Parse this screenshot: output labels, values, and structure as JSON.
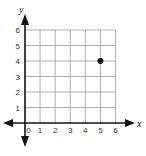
{
  "chart_data": {
    "type": "scatter",
    "title": "",
    "xlabel": "x",
    "ylabel": "y",
    "xlim": [
      0,
      6
    ],
    "ylim": [
      0,
      6
    ],
    "grid": true,
    "x_ticks": [
      "0",
      "1",
      "2",
      "3",
      "4",
      "5",
      "6"
    ],
    "y_ticks": [
      "1",
      "2",
      "3",
      "4",
      "5",
      "6"
    ],
    "points": [
      {
        "x": 5,
        "y": 4
      }
    ],
    "series": [
      {
        "name": "point",
        "values": [
          {
            "x": 5,
            "y": 4
          }
        ]
      }
    ]
  },
  "colors": {
    "grid": "#9a9a9a",
    "axis": "#111111",
    "point": "#111111"
  }
}
